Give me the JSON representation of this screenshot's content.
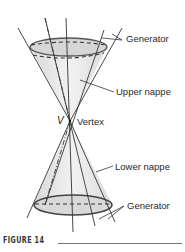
{
  "figure": {
    "caption": "FIGURE 14",
    "labels": {
      "generator_top": "Generator",
      "upper_nappe": "Upper nappe",
      "vertex_symbol": "V",
      "vertex": "Vertex",
      "lower_nappe": "Lower nappe",
      "generator_bottom": "Generator"
    },
    "colors": {
      "cone_fill": "#e6e6e6",
      "ellipse_fill": "#cfcfcf",
      "stroke": "#333333"
    }
  }
}
